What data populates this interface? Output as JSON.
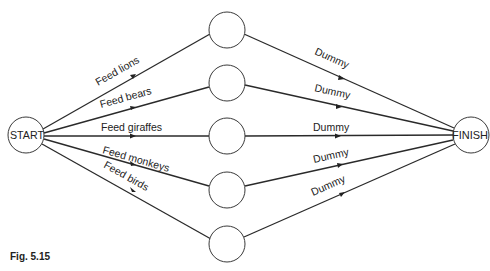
{
  "diagram": {
    "type": "activity-network",
    "start_node": {
      "label": "START",
      "x": 26,
      "y": 135,
      "r": 18
    },
    "finish_node": {
      "label": "FINISH",
      "x": 471,
      "y": 135,
      "r": 18
    },
    "intermediate_nodes": [
      {
        "x": 227,
        "y": 30,
        "r": 18
      },
      {
        "x": 227,
        "y": 83,
        "r": 18
      },
      {
        "x": 227,
        "y": 136,
        "r": 18
      },
      {
        "x": 227,
        "y": 190,
        "r": 18
      },
      {
        "x": 227,
        "y": 244,
        "r": 18
      }
    ],
    "activities": [
      {
        "label": "Feed lions",
        "from": "START",
        "to": 0
      },
      {
        "label": "Feed bears",
        "from": "START",
        "to": 1
      },
      {
        "label": "Feed giraffes",
        "from": "START",
        "to": 2
      },
      {
        "label": "Feed monkeys",
        "from": "START",
        "to": 3
      },
      {
        "label": "Feed birds",
        "from": "START",
        "to": 4
      }
    ],
    "dummies": [
      {
        "label": "Dummy",
        "from": 0,
        "to": "FINISH"
      },
      {
        "label": "Dummy",
        "from": 1,
        "to": "FINISH"
      },
      {
        "label": "Dummy",
        "from": 2,
        "to": "FINISH"
      },
      {
        "label": "Dummy",
        "from": 3,
        "to": "FINISH"
      },
      {
        "label": "Dummy",
        "from": 4,
        "to": "FINISH"
      }
    ]
  },
  "caption": "Fig. 5.15"
}
